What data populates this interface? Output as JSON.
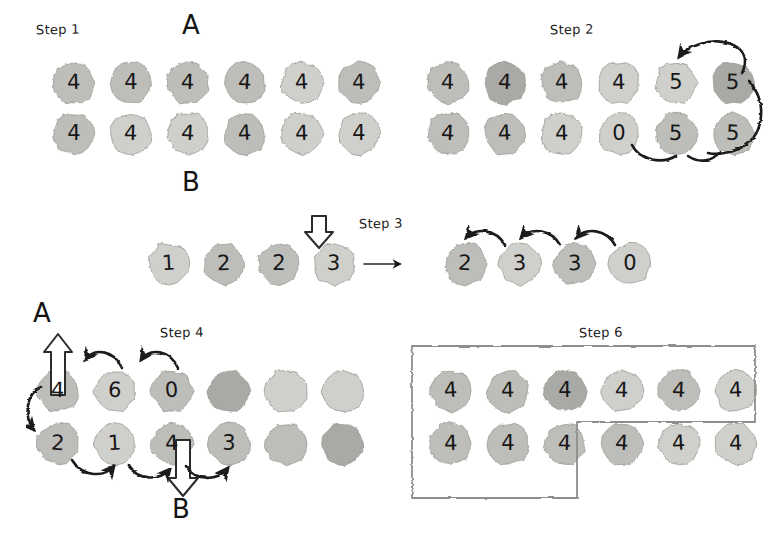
{
  "figure": {
    "background": "#ffffff",
    "ink_color": "#1a1a1a",
    "blob_fill_light": "#cfcfcb",
    "blob_fill_mid": "#bdbdb9",
    "blob_fill_dark": "#a9a9a5",
    "blob_stroke": "#9a9a96"
  },
  "steps": [
    {
      "id": "step1",
      "label": "Step 1",
      "label_pos": {
        "x": 36,
        "y": 28
      },
      "top_label": {
        "text": "A",
        "x": 182,
        "y": 19
      },
      "bottom_label": {
        "text": "B",
        "x": 182,
        "y": 176
      },
      "rows": [
        {
          "name": "row-a",
          "y": 60,
          "x0": 51,
          "dx": 57,
          "cells": [
            {
              "value": "4",
              "shade": "mid"
            },
            {
              "value": "4",
              "shade": "mid"
            },
            {
              "value": "4",
              "shade": "mid"
            },
            {
              "value": "4",
              "shade": "mid"
            },
            {
              "value": "4",
              "shade": "light"
            },
            {
              "value": "4",
              "shade": "mid"
            }
          ]
        },
        {
          "name": "row-b",
          "y": 111,
          "x0": 51,
          "dx": 57,
          "cells": [
            {
              "value": "4",
              "shade": "mid"
            },
            {
              "value": "4",
              "shade": "light"
            },
            {
              "value": "4",
              "shade": "light"
            },
            {
              "value": "4",
              "shade": "mid"
            },
            {
              "value": "4",
              "shade": "light"
            },
            {
              "value": "4",
              "shade": "light"
            }
          ]
        }
      ]
    },
    {
      "id": "step2",
      "label": "Step 2",
      "label_pos": {
        "x": 550,
        "y": 28
      },
      "rows": [
        {
          "name": "row-a",
          "y": 60,
          "x0": 425,
          "dx": 57,
          "cells": [
            {
              "value": "4",
              "shade": "mid"
            },
            {
              "value": "4",
              "shade": "dark"
            },
            {
              "value": "4",
              "shade": "mid"
            },
            {
              "value": "4",
              "shade": "light"
            },
            {
              "value": "5",
              "shade": "light"
            },
            {
              "value": "5",
              "shade": "dark"
            }
          ]
        },
        {
          "name": "row-b",
          "y": 111,
          "x0": 425,
          "dx": 57,
          "cells": [
            {
              "value": "4",
              "shade": "mid"
            },
            {
              "value": "4",
              "shade": "mid"
            },
            {
              "value": "4",
              "shade": "light"
            },
            {
              "value": "0",
              "shade": "light"
            },
            {
              "value": "5",
              "shade": "mid"
            },
            {
              "value": "5",
              "shade": "mid"
            }
          ]
        }
      ]
    },
    {
      "id": "step3",
      "label": "Step 3",
      "label_pos": {
        "x": 359,
        "y": 221
      },
      "transition_arrow": "→",
      "before": {
        "name": "before-row",
        "y": 241,
        "x0": 146,
        "dx": 55,
        "cells": [
          {
            "value": "1",
            "shade": "light"
          },
          {
            "value": "2",
            "shade": "mid"
          },
          {
            "value": "2",
            "shade": "mid"
          },
          {
            "value": "3",
            "shade": "light"
          }
        ]
      },
      "after": {
        "name": "after-row",
        "y": 241,
        "x0": 442,
        "dx": 55,
        "cells": [
          {
            "value": "2",
            "shade": "mid"
          },
          {
            "value": "3",
            "shade": "light"
          },
          {
            "value": "3",
            "shade": "mid"
          },
          {
            "value": "0",
            "shade": "light"
          }
        ]
      },
      "cursor_note": "white outline arrow pointing down at last cell of before-row"
    },
    {
      "id": "step4",
      "label": "Step 4",
      "label_pos": {
        "x": 160,
        "y": 330
      },
      "top_label": {
        "text": "A",
        "x": 33,
        "y": 306
      },
      "bottom_label": {
        "text": "B",
        "x": 172,
        "y": 500
      },
      "rows": [
        {
          "name": "row-a",
          "y": 368,
          "x0": 35,
          "dx": 57,
          "cells": [
            {
              "value": "4",
              "shade": "mid"
            },
            {
              "value": "6",
              "shade": "light"
            },
            {
              "value": "0",
              "shade": "mid"
            },
            {
              "value": "",
              "shade": "dark"
            },
            {
              "value": "",
              "shade": "light"
            },
            {
              "value": "",
              "shade": "light"
            }
          ]
        },
        {
          "name": "row-b",
          "y": 421,
          "x0": 35,
          "dx": 57,
          "cells": [
            {
              "value": "2",
              "shade": "mid"
            },
            {
              "value": "1",
              "shade": "light"
            },
            {
              "value": "4",
              "shade": "mid"
            },
            {
              "value": "3",
              "shade": "mid"
            },
            {
              "value": "",
              "shade": "mid"
            },
            {
              "value": "",
              "shade": "dark"
            }
          ]
        }
      ]
    },
    {
      "id": "step6",
      "label": "Step 6",
      "label_pos": {
        "x": 579,
        "y": 330
      },
      "rows": [
        {
          "name": "row-a",
          "y": 368,
          "x0": 428,
          "dx": 57,
          "cells": [
            {
              "value": "4",
              "shade": "mid"
            },
            {
              "value": "4",
              "shade": "mid"
            },
            {
              "value": "4",
              "shade": "dark"
            },
            {
              "value": "4",
              "shade": "light"
            },
            {
              "value": "4",
              "shade": "mid"
            },
            {
              "value": "4",
              "shade": "light"
            }
          ]
        },
        {
          "name": "row-b",
          "y": 421,
          "x0": 428,
          "dx": 57,
          "cells": [
            {
              "value": "4",
              "shade": "mid"
            },
            {
              "value": "4",
              "shade": "mid"
            },
            {
              "value": "4",
              "shade": "mid"
            },
            {
              "value": "4",
              "shade": "mid"
            },
            {
              "value": "4",
              "shade": "light"
            },
            {
              "value": "4",
              "shade": "light"
            }
          ]
        }
      ],
      "region_note": "stair-step hand-drawn boundary enclosing all of row A plus the first three cells of row B"
    }
  ]
}
